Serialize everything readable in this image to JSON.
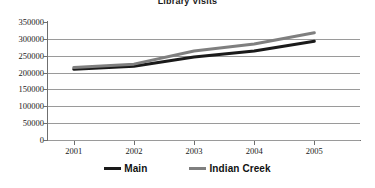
{
  "chart_data": {
    "type": "line",
    "title": "Library Visits",
    "xlabel": "",
    "ylabel": "",
    "categories": [
      "2001",
      "2002",
      "2003",
      "2004",
      "2005"
    ],
    "series": [
      {
        "name": "Main",
        "color": "#1a1a1a",
        "values": [
          210000,
          219000,
          246000,
          264000,
          293000
        ]
      },
      {
        "name": "Indian Creek",
        "color": "#7f7f7f",
        "values": [
          215000,
          225000,
          264000,
          285000,
          318000
        ]
      }
    ],
    "ylim": [
      0,
      350000
    ],
    "ytick_labels": [
      "350000",
      "300000",
      "250000",
      "200000",
      "150000",
      "100000",
      "50000",
      "0"
    ],
    "ytick_values": [
      350000,
      300000,
      250000,
      200000,
      150000,
      100000,
      50000,
      0
    ],
    "grid": true,
    "legend_position": "bottom"
  },
  "legend": {
    "items": [
      {
        "label": "Main",
        "color": "#1a1a1a"
      },
      {
        "label": "Indian Creek",
        "color": "#7f7f7f"
      }
    ]
  },
  "colors": {
    "main_series": "#1a1a1a",
    "indian_creek_series": "#7f7f7f",
    "gridline": "#9a9a9a",
    "axis": "#6f6f6f",
    "background": "#ffffff"
  }
}
